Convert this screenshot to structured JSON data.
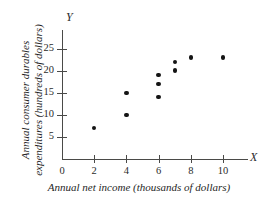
{
  "chart_data": {
    "type": "scatter",
    "title": "",
    "xlabel": "Annual net income (thousands of dollars)",
    "ylabel": "Annual consumer durables expenditures (hundreds of dollars)",
    "x_axis_letter": "X",
    "y_axis_letter": "Y",
    "xlim": [
      0,
      11.6
    ],
    "ylim": [
      0,
      29
    ],
    "grid": false,
    "legend": null,
    "x_ticks": [
      {
        "value": 0,
        "label": "0"
      },
      {
        "value": 2,
        "label": "2"
      },
      {
        "value": 4,
        "label": "4"
      },
      {
        "value": 6,
        "label": "6"
      },
      {
        "value": 8,
        "label": "8"
      },
      {
        "value": 10,
        "label": "10"
      }
    ],
    "y_ticks": [
      {
        "value": 5,
        "label": "5"
      },
      {
        "value": 10,
        "label": "10"
      },
      {
        "value": 15,
        "label": "15"
      },
      {
        "value": 20,
        "label": "20"
      },
      {
        "value": 25,
        "label": "25"
      }
    ],
    "points": [
      {
        "x": 2,
        "y": 7
      },
      {
        "x": 4,
        "y": 10
      },
      {
        "x": 4,
        "y": 15
      },
      {
        "x": 6,
        "y": 14
      },
      {
        "x": 6,
        "y": 17
      },
      {
        "x": 6,
        "y": 19
      },
      {
        "x": 7,
        "y": 20
      },
      {
        "x": 7,
        "y": 22
      },
      {
        "x": 8,
        "y": 23
      },
      {
        "x": 10,
        "y": 23
      }
    ],
    "marker_color": "#141414",
    "axis_color": "#4a4a48",
    "background_color": "#ffffff"
  }
}
